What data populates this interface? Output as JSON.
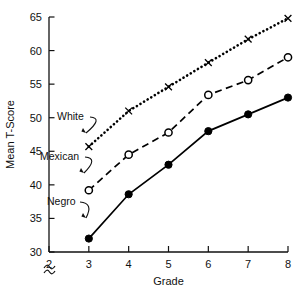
{
  "chart_data": {
    "type": "line",
    "title": "",
    "xlabel": "Grade",
    "ylabel": "Mean T-Score",
    "xlim": [
      2,
      8
    ],
    "ylim": [
      30,
      65
    ],
    "xticks": [
      2,
      3,
      4,
      5,
      6,
      7,
      8
    ],
    "yticks": [
      30,
      35,
      40,
      45,
      50,
      55,
      60,
      65
    ],
    "grid": false,
    "legend_position": "inline-annotations",
    "y_axis_break": true,
    "y_axis_break_symbol": "~",
    "x": [
      3,
      4,
      5,
      6,
      7,
      8
    ],
    "series": [
      {
        "name": "White",
        "values": [
          45.7,
          51.0,
          54.6,
          58.2,
          61.7,
          64.8
        ],
        "marker": "x",
        "linestyle": "dotted",
        "color": "#000000"
      },
      {
        "name": "Mexican",
        "values": [
          39.2,
          44.5,
          47.8,
          53.4,
          55.6,
          59.0
        ],
        "marker": "open-circle",
        "linestyle": "dashed",
        "color": "#000000"
      },
      {
        "name": "Negro",
        "values": [
          32.0,
          38.6,
          43.0,
          48.0,
          50.5,
          53.0
        ],
        "marker": "filled-circle",
        "linestyle": "solid",
        "color": "#000000"
      }
    ],
    "annotations": [
      {
        "text": "White",
        "series": "White",
        "points_to_grade": 3
      },
      {
        "text": "Mexican",
        "series": "Mexican",
        "points_to_grade": 3
      },
      {
        "text": "Negro",
        "series": "Negro",
        "points_to_grade": 3
      }
    ]
  },
  "axis": {
    "y_title": "Mean T-Score",
    "x_title": "Grade",
    "y_tick_labels": [
      "65",
      "60",
      "55",
      "50",
      "45",
      "40",
      "35",
      "30"
    ],
    "x_tick_labels": [
      "2",
      "3",
      "4",
      "5",
      "6",
      "7",
      "8"
    ],
    "break_symbol": "~"
  },
  "labels": {
    "white": "White",
    "mexican": "Mexican",
    "negro": "Negro"
  }
}
